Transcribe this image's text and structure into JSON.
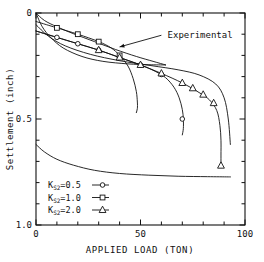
{
  "chart_data": {
    "type": "line",
    "title": "",
    "xlabel": "APPLIED LOAD (TON)",
    "ylabel": "Settlement (inch)",
    "xlim": [
      0,
      100
    ],
    "ylim": [
      0,
      1.0
    ],
    "y_inverted": true,
    "grid": false,
    "legend_position": "bottom-left",
    "x_major_ticks": [
      0,
      50,
      100
    ],
    "x_major_tick_labels": [
      "0",
      "50",
      "100"
    ],
    "x_minor_tick_step": 10,
    "y_major_ticks": [
      0,
      0.5,
      1.0
    ],
    "y_major_tick_labels": [
      "0",
      "0.5",
      "1.0"
    ],
    "y_minor_tick_step": 0.1,
    "annotations": [
      {
        "text": "Experimental",
        "x": 62,
        "y": 0.105,
        "arrow_from_x": 60,
        "arrow_from_y": 0.105,
        "arrow_to_x": 40,
        "arrow_to_y": 0.16
      }
    ],
    "series": [
      {
        "name": "K_S2=0.5",
        "label": "K",
        "subscript": "S2",
        "value_label": "=0.5",
        "marker": "circle",
        "x": [
          0,
          5,
          10,
          20,
          30,
          40,
          50,
          57,
          62,
          66,
          68.5,
          70,
          70.5,
          70.5,
          70
        ],
        "y": [
          0.085,
          0.1,
          0.115,
          0.145,
          0.175,
          0.21,
          0.245,
          0.275,
          0.305,
          0.35,
          0.4,
          0.455,
          0.5,
          0.545,
          0.575
        ],
        "marker_x": [
          10,
          20,
          30,
          40,
          50,
          60,
          70
        ],
        "marker_y": [
          0.115,
          0.145,
          0.175,
          0.21,
          0.245,
          0.29,
          0.5
        ]
      },
      {
        "name": "K_S2=1.0",
        "label": "K",
        "subscript": "S2",
        "value_label": "=1.0",
        "marker": "square",
        "x": [
          0,
          5,
          10,
          20,
          30,
          36,
          40,
          44,
          46.5,
          48,
          48.5,
          48.5,
          48
        ],
        "y": [
          0.04,
          0.055,
          0.07,
          0.1,
          0.135,
          0.165,
          0.2,
          0.25,
          0.31,
          0.37,
          0.42,
          0.45,
          0.47
        ],
        "marker_x": [
          10,
          20,
          30,
          40
        ],
        "marker_y": [
          0.07,
          0.1,
          0.135,
          0.2
        ]
      },
      {
        "name": "K_S2=2.0",
        "label": "K",
        "subscript": "S2",
        "value_label": "=2.0",
        "marker": "triangle",
        "x": [
          0,
          5,
          10,
          20,
          30,
          40,
          50,
          60,
          70,
          78,
          83,
          86.5,
          88,
          88.5,
          88.5,
          88.5
        ],
        "y": [
          0.085,
          0.1,
          0.115,
          0.145,
          0.175,
          0.21,
          0.245,
          0.285,
          0.33,
          0.375,
          0.41,
          0.46,
          0.53,
          0.6,
          0.67,
          0.72
        ],
        "marker_x": [
          30,
          40,
          50,
          60,
          70,
          75,
          80,
          85,
          88.5
        ],
        "marker_y": [
          0.175,
          0.21,
          0.245,
          0.285,
          0.33,
          0.355,
          0.385,
          0.425,
          0.72
        ]
      },
      {
        "name": "experimental-upper",
        "marker": "none",
        "x": [
          0,
          4,
          10,
          18,
          28,
          38,
          48,
          56,
          62
        ],
        "y": [
          0.0,
          0.035,
          0.065,
          0.098,
          0.135,
          0.172,
          0.205,
          0.228,
          0.245
        ],
        "marker_x": [],
        "marker_y": []
      },
      {
        "name": "experimental-lower",
        "marker": "none",
        "x": [
          0,
          3,
          7,
          13,
          22,
          32,
          44,
          54,
          62
        ],
        "y": [
          0.0,
          0.065,
          0.115,
          0.165,
          0.205,
          0.228,
          0.24,
          0.244,
          0.245
        ],
        "marker_x": [],
        "marker_y": []
      },
      {
        "name": "computed-envelope-right",
        "marker": "none",
        "x": [
          0,
          6,
          14,
          26,
          40,
          55,
          68,
          78,
          86,
          90,
          92,
          93
        ],
        "y": [
          0.055,
          0.11,
          0.155,
          0.195,
          0.225,
          0.248,
          0.268,
          0.292,
          0.335,
          0.4,
          0.5,
          0.62
        ],
        "marker_x": [],
        "marker_y": []
      },
      {
        "name": "lower-baseline-curve",
        "marker": "none",
        "x": [
          0,
          4,
          10,
          18,
          28,
          40,
          54,
          68,
          82,
          92,
          93
        ],
        "y": [
          0.62,
          0.655,
          0.69,
          0.718,
          0.742,
          0.757,
          0.765,
          0.77,
          0.772,
          0.773,
          0.773
        ],
        "marker_x": [],
        "marker_y": []
      }
    ]
  },
  "legend": {
    "entries": [
      {
        "label": "K",
        "subscript": "S2",
        "value": "=0.5",
        "marker": "circle"
      },
      {
        "label": "K",
        "subscript": "S2",
        "value": "=1.0",
        "marker": "square"
      },
      {
        "label": "K",
        "subscript": "S2",
        "value": "=2.0",
        "marker": "triangle"
      }
    ]
  }
}
